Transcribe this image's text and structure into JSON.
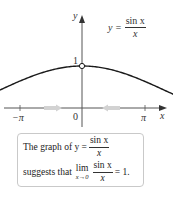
{
  "chart_data": {
    "type": "line",
    "title": "",
    "function": "y = sin x / x",
    "xlabel": "x",
    "ylabel": "y",
    "xlim": [
      -3.6,
      3.9
    ],
    "ylim": [
      -0.3,
      1.6
    ],
    "x_ticks": [
      {
        "value": -3.14159,
        "label": "−π"
      },
      {
        "value": 0,
        "label": "0"
      },
      {
        "value": 3.14159,
        "label": "π"
      }
    ],
    "y_ticks": [
      {
        "value": 1,
        "label": "1"
      }
    ],
    "series": [
      {
        "name": "y = sin x / x",
        "x": [
          -3.5,
          -3.14159,
          -2.5,
          -2.0,
          -1.5,
          -1.0,
          -0.5,
          0,
          0.5,
          1.0,
          1.5,
          2.0,
          2.5,
          3.14159,
          3.6
        ],
        "y": [
          -0.1,
          0.0,
          0.239,
          0.455,
          0.665,
          0.841,
          0.959,
          1.0,
          0.959,
          0.841,
          0.665,
          0.455,
          0.239,
          0.0,
          -0.123
        ]
      }
    ],
    "annotations": [
      {
        "type": "open-circle",
        "x": 0,
        "y": 1,
        "note": "function undefined at x = 0"
      },
      {
        "type": "arrow",
        "direction": "right",
        "position": "between −π and 0 on x-axis",
        "color": "#c8c8c8"
      },
      {
        "type": "arrow",
        "direction": "left",
        "position": "between 0 and π on x-axis",
        "color": "#c8c8c8"
      }
    ],
    "grid": false,
    "legend": "none"
  },
  "labels": {
    "y_axis": "y",
    "x_axis": "x",
    "tick_one": "1",
    "tick_zero": "0",
    "tick_neg_pi": "−π",
    "tick_pi": "π",
    "curve_label_lhs": "y =",
    "curve_label_num": "sin x",
    "curve_label_den": "x"
  },
  "note": {
    "line1_prefix": "The graph of y =",
    "line1_num": "sin x",
    "line1_den": "x",
    "line2_prefix": "suggests that",
    "lim_word": "lim",
    "lim_sub": "x→0",
    "line2_num": "sin x",
    "line2_den": "x",
    "line2_suffix": "= 1."
  },
  "colors": {
    "curve": "#1a1a1a",
    "axis": "#555555",
    "arrow_hint": "#cfcfcf",
    "box_border": "#c9c9c9"
  }
}
